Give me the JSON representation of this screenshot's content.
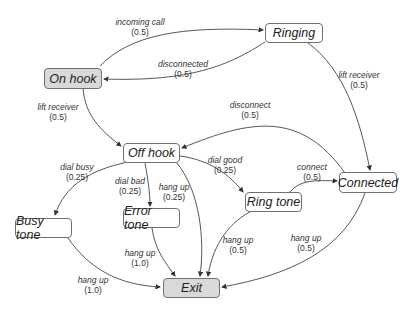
{
  "diagram": {
    "type": "state-machine",
    "colors": {
      "start_fill": "#d9d9d9",
      "node_fill": "#ffffff",
      "border": "#707070",
      "edge": "#333333"
    },
    "nodes": {
      "on_hook": {
        "label": "On hook",
        "filled": true
      },
      "ringing": {
        "label": "Ringing",
        "filled": false
      },
      "off_hook": {
        "label": "Off hook",
        "filled": false
      },
      "connected": {
        "label": "Connected",
        "filled": false
      },
      "ring_tone": {
        "label": "Ring tone",
        "filled": false
      },
      "error_tone": {
        "label": "Error tone",
        "filled": false
      },
      "busy_tone": {
        "label": "Busy tone",
        "filled": false
      },
      "exit": {
        "label": "Exit",
        "filled": true
      }
    },
    "edges": {
      "incoming_call": {
        "from": "On hook",
        "to": "Ringing",
        "label": "incoming call",
        "prob": "(0.5)"
      },
      "disconnected": {
        "from": "Ringing",
        "to": "On hook",
        "label": "disconnected",
        "prob": "(0.5)"
      },
      "lift_receiver_onhook": {
        "from": "On hook",
        "to": "Off hook",
        "label": "lift receiver",
        "prob": "(0.5)"
      },
      "lift_receiver_ringing": {
        "from": "Ringing",
        "to": "Connected",
        "label": "lift receiver",
        "prob": "(0.5)"
      },
      "disconnect": {
        "from": "Connected",
        "to": "Off hook",
        "label": "disconnect",
        "prob": "(0.5)"
      },
      "dial_busy": {
        "from": "Off hook",
        "to": "Busy tone",
        "label": "dial busy",
        "prob": "(0.25)"
      },
      "dial_bad": {
        "from": "Off hook",
        "to": "Error tone",
        "label": "dial bad",
        "prob": "(0.25)"
      },
      "hang_up_offhook": {
        "from": "Off hook",
        "to": "Exit",
        "label": "hang up",
        "prob": "(0.25)"
      },
      "dial_good": {
        "from": "Off hook",
        "to": "Ring tone",
        "label": "dial good",
        "prob": "(0.25)"
      },
      "connect": {
        "from": "Ring tone",
        "to": "Connected",
        "label": "connect",
        "prob": "(0.5)"
      },
      "hang_up_error": {
        "from": "Error tone",
        "to": "Exit",
        "label": "hang up",
        "prob": "(1.0)"
      },
      "hang_up_busy": {
        "from": "Busy tone",
        "to": "Exit",
        "label": "hang up",
        "prob": "(1.0)"
      },
      "hang_up_ringtone": {
        "from": "Ring tone",
        "to": "Exit",
        "label": "hang up",
        "prob": "(0.5)"
      },
      "hang_up_connected": {
        "from": "Connected",
        "to": "Exit",
        "label": "hang up",
        "prob": "(0.5)"
      }
    }
  }
}
